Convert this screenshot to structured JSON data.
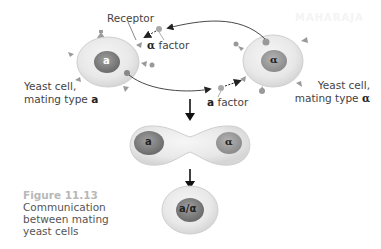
{
  "figure": {
    "number": "Figure 11.13",
    "caption_lines": [
      "Communication",
      "between mating",
      "yeast cells"
    ]
  },
  "labels": {
    "receptor": "Receptor",
    "alpha_factor_symbol": "α",
    "alpha_factor_text": " factor",
    "a_factor_symbol": "a",
    "a_factor_text": " factor",
    "cell_a_line1": "Yeast cell,",
    "cell_a_line2": "mating type ",
    "cell_a_type": "a",
    "cell_alpha_line1": "Yeast cell,",
    "cell_alpha_line2": "mating type ",
    "cell_alpha_type": "α"
  },
  "nuclei": {
    "cell_a": "a",
    "cell_alpha": "α",
    "fusing_a": "a",
    "fusing_alpha": "α",
    "diploid": "a/α"
  },
  "watermark": "MAHARAJA",
  "colors": {
    "cell_fill": "#e9e9e9",
    "cell_edge": "#c9c9c9",
    "nucleus": "#8a8a8a",
    "nucleus_dark": "#6e6e6e",
    "receptor": "#9a9a9a",
    "arrow": "#222222"
  }
}
